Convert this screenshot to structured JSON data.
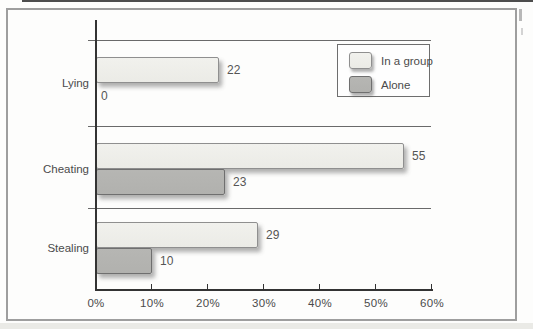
{
  "chart_data": {
    "type": "bar",
    "orientation": "horizontal",
    "title": "",
    "categories": [
      "Lying",
      "Cheating",
      "Stealing"
    ],
    "series": [
      {
        "name": "In a group",
        "values": [
          22,
          55,
          29
        ],
        "fill": "#ebebe6",
        "fill_top": "#f1f1ed",
        "border": "#8f8f8f"
      },
      {
        "name": "Alone",
        "values": [
          0,
          23,
          10
        ],
        "fill": "#b1b1ae",
        "fill_top": "#b6b6b3",
        "border": "#6f6f6f"
      }
    ],
    "x_ticks": [
      "0%",
      "10%",
      "20%",
      "30%",
      "40%",
      "50%",
      "60%"
    ],
    "x_tick_values": [
      0,
      10,
      20,
      30,
      40,
      50,
      60
    ],
    "xlim": [
      0,
      60
    ],
    "xlabel": "",
    "ylabel": "",
    "legend_position": "top-right",
    "grid": "horizontal-category-separators",
    "value_labels_shown": true
  },
  "colors": {
    "axis": "#333333",
    "gridline": "#6a6a6a",
    "text": "#4b4b4b",
    "frame_border": "#9e9e9e",
    "top_rule": "#4d4d4d",
    "background": "#fdfdfc"
  }
}
